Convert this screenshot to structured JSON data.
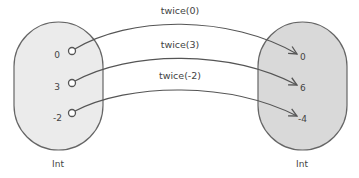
{
  "diagram": {
    "domain": {
      "label": "Int",
      "fill": "#ebebeb",
      "values": [
        "0",
        "3",
        "-2"
      ]
    },
    "codomain": {
      "label": "Int",
      "fill": "#d9d9d9",
      "values": [
        "0",
        "6",
        "-4"
      ]
    },
    "mappings": [
      {
        "label": "twice(0)",
        "from": "0",
        "to": "0"
      },
      {
        "label": "twice(3)",
        "from": "3",
        "to": "6"
      },
      {
        "label": "twice(-2)",
        "from": "-2",
        "to": "-4"
      }
    ],
    "colors": {
      "stroke": "#555555",
      "text": "#444444"
    }
  }
}
